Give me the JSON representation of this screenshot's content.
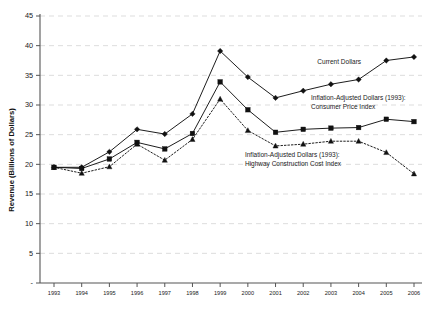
{
  "chart_data": {
    "type": "line",
    "title": "",
    "xlabel": "",
    "ylabel": "Revenue (Billions of Dollars)",
    "ylim": [
      0,
      45
    ],
    "yticks": [
      0,
      5,
      10,
      15,
      20,
      25,
      30,
      35,
      40,
      45
    ],
    "ytick_labels": [
      "-",
      "5",
      "10",
      "15",
      "20",
      "25",
      "30",
      "35",
      "40",
      "45"
    ],
    "grid": true,
    "legend_position": "inline-annotations",
    "categories": [
      "1993",
      "1994",
      "1995",
      "1996",
      "1997",
      "1998",
      "1999",
      "2000",
      "2001",
      "2002",
      "2003",
      "2004",
      "2005",
      "2006"
    ],
    "x": [
      1993,
      1994,
      1995,
      1996,
      1997,
      1998,
      1999,
      2000,
      2001,
      2002,
      2003,
      2004,
      2005,
      2006
    ],
    "series": [
      {
        "name": "Current Dollars",
        "marker": "diamond",
        "linestyle": "solid",
        "color": "#111111",
        "values": [
          19.5,
          19.5,
          22.1,
          25.9,
          25.1,
          28.5,
          39.1,
          34.7,
          31.2,
          32.4,
          33.5,
          34.3,
          37.5,
          38.1
        ]
      },
      {
        "name": "Inflation-Adjusted Dollars (1993): Consumer Price Index",
        "marker": "square",
        "linestyle": "solid",
        "color": "#111111",
        "values": [
          19.5,
          19.3,
          20.9,
          23.7,
          22.6,
          25.2,
          33.9,
          29.2,
          25.4,
          25.9,
          26.1,
          26.2,
          27.6,
          27.2
        ]
      },
      {
        "name": "Inflation-Adjusted Dollars (1993): Highway Construction Cost Index",
        "marker": "triangle",
        "linestyle": "dotted",
        "color": "#111111",
        "values": [
          19.5,
          18.5,
          19.6,
          23.4,
          20.7,
          24.2,
          31.0,
          25.7,
          23.1,
          23.4,
          23.9,
          23.9,
          22.0,
          18.4
        ]
      }
    ],
    "annotations": [
      {
        "id": "ann-current-dollars",
        "lines": [
          "Current Dollars"
        ],
        "x_pct": 74.5,
        "y_pct": 18.5
      },
      {
        "id": "ann-cpi",
        "lines": [
          "Inflation-Adjusted Dollars (1993):",
          "Consumer Price Index"
        ],
        "x_pct": 73.0,
        "y_pct": 30.0
      },
      {
        "id": "ann-hcci",
        "lines": [
          "Inflation-Adjusted Dollars (1993):",
          "Highway Construction Cost Index"
        ],
        "x_pct": 57.5,
        "y_pct": 48.5
      }
    ]
  }
}
